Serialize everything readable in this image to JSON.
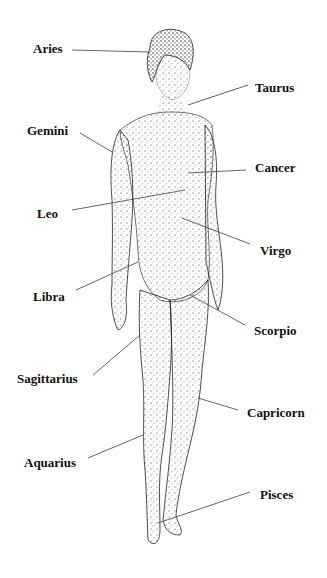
{
  "diagram": {
    "colors": {
      "ink": "#111111",
      "line": "#555555",
      "background": "#ffffff"
    },
    "labels": [
      {
        "id": "aries",
        "text": "Aries",
        "x": 33,
        "y": 42,
        "line": [
          72,
          50,
          150,
          52
        ]
      },
      {
        "id": "taurus",
        "text": "Taurus",
        "x": 255,
        "y": 81,
        "line": [
          248,
          85,
          188,
          105
        ]
      },
      {
        "id": "gemini",
        "text": "Gemini",
        "x": 27,
        "y": 124,
        "line": [
          80,
          133,
          112,
          152
        ]
      },
      {
        "id": "cancer",
        "text": "Cancer",
        "x": 255,
        "y": 161,
        "line": [
          246,
          170,
          188,
          173
        ]
      },
      {
        "id": "leo",
        "text": "Leo",
        "x": 37,
        "y": 207,
        "line": [
          72,
          210,
          185,
          190
        ]
      },
      {
        "id": "virgo",
        "text": "Virgo",
        "x": 260,
        "y": 244,
        "line": [
          250,
          244,
          182,
          218
        ]
      },
      {
        "id": "libra",
        "text": "Libra",
        "x": 33,
        "y": 290,
        "line": [
          76,
          290,
          138,
          262
        ]
      },
      {
        "id": "scorpio",
        "text": "Scorpio",
        "x": 254,
        "y": 324,
        "line": [
          245,
          325,
          190,
          295
        ]
      },
      {
        "id": "sagittarius",
        "text": "Sagittarius",
        "x": 17,
        "y": 372,
        "line": [
          93,
          375,
          140,
          335
        ]
      },
      {
        "id": "capricorn",
        "text": "Capricorn",
        "x": 247,
        "y": 406,
        "line": [
          238,
          410,
          198,
          398
        ]
      },
      {
        "id": "aquarius",
        "text": "Aquarius",
        "x": 24,
        "y": 456,
        "line": [
          88,
          458,
          143,
          435
        ]
      },
      {
        "id": "pisces",
        "text": "Pisces",
        "x": 260,
        "y": 488,
        "line": [
          250,
          492,
          158,
          523
        ]
      }
    ]
  }
}
